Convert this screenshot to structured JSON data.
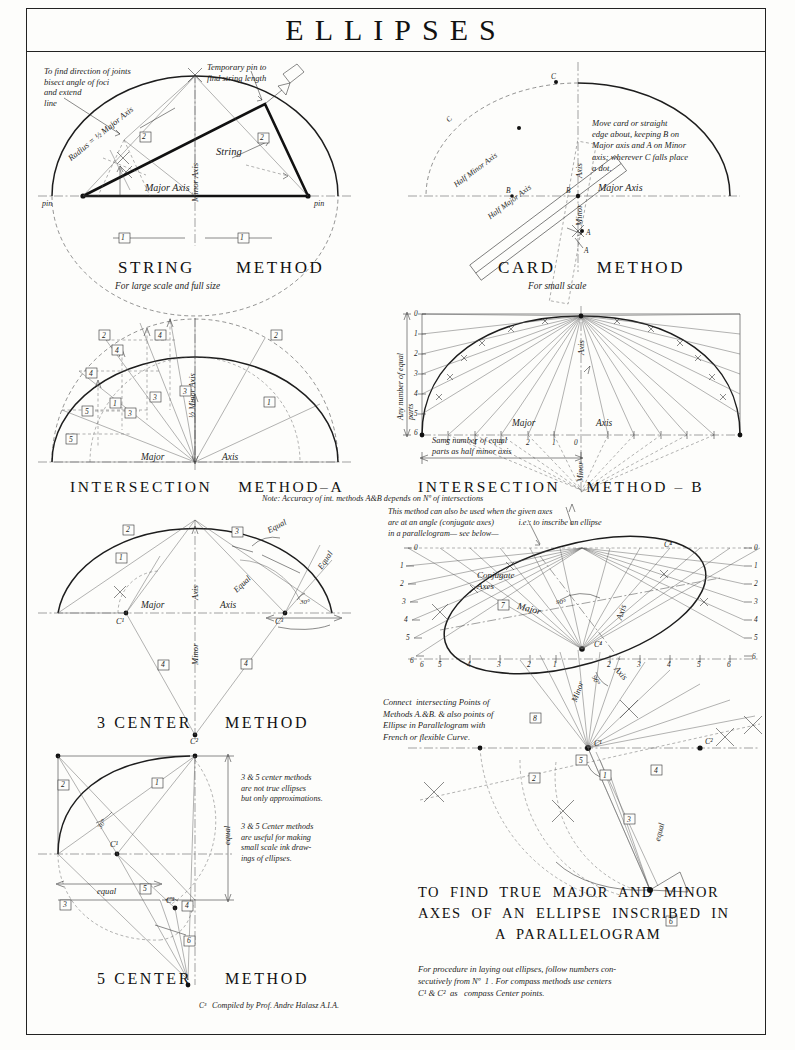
{
  "plate": {
    "title": "ELLIPSES",
    "credit": "Compiled by Prof. Andre Halasz A.I.A.",
    "credit_marker": "C³"
  },
  "panels": {
    "string_method": {
      "heading": "STRING      METHOD",
      "subtitle": "For large scale and full size",
      "notes": [
        "To find direction of joints\nbisect angle of foci\nand extend\nline",
        "Temporary pin to\nfind string length"
      ],
      "labels": {
        "radius": "Radius = ½ Major Axis",
        "string": "String",
        "major_axis": "Major Axis",
        "minor": "Minor",
        "axis": "Axis",
        "pin_left": "pin",
        "pin_right": "pin"
      },
      "steps": [
        "1",
        "1",
        "2",
        "2"
      ]
    },
    "card_method": {
      "heading": "CARD      METHOD",
      "subtitle": "For small scale",
      "note": "Move card or straight\nedge about, keeping B on\nMajor axis and A on Minor\naxis; wherever C falls place\na dot.",
      "labels": {
        "half_minor": "Half Minor Axis",
        "half_major": "Half Major Axis",
        "major_axis": "Major Axis",
        "minor": "Minor",
        "axis": "Axis",
        "points": [
          "A",
          "B",
          "C"
        ],
        "card_points": [
          "A",
          "B",
          "C"
        ]
      }
    },
    "intersection_a": {
      "heading": "INTERSECTION    METHOD–A",
      "note": "Note: Accuracy of int. methods A&B depends on Nº of intersections",
      "labels": {
        "major": "Major",
        "axis": "Axis",
        "half_minor_axis": "½ Minor Axis"
      },
      "steps": [
        "1",
        "1",
        "2",
        "2",
        "3",
        "3",
        "3",
        "4",
        "4",
        "4",
        "5",
        "5"
      ]
    },
    "intersection_b": {
      "heading": "INTERSECTION    METHOD – B",
      "note": "This method can also be used when the given axes\nare at an angle (conjugate axes)            i.e.: to inscribe an ellipse\nin a parallelogram— see below—",
      "labels": {
        "vertical_scale": "Any number of equal\nparts",
        "horizontal_scale": "Same number of equal\nparts as half minor axis",
        "major": "Major",
        "axis": "Axis",
        "minor": "Minor"
      },
      "v_ticks": [
        "0",
        "1",
        "2",
        "3",
        "4",
        "5",
        "6"
      ],
      "h_ticks": [
        "5",
        "4",
        "3",
        "2",
        "1",
        "0"
      ]
    },
    "three_center": {
      "heading": "3 CENTER     METHOD",
      "labels": {
        "major": "Major",
        "axis": "Axis",
        "minor": "Minor",
        "axis_v": "Axis",
        "equal": [
          "Equal",
          "Equal",
          "Equal"
        ],
        "angle": "30°",
        "centers": [
          "C¹",
          "C³",
          "C²"
        ]
      },
      "steps": [
        "1",
        "2",
        "3",
        "4",
        "4"
      ]
    },
    "five_center": {
      "heading": "5 CENTER     METHOD",
      "notes": [
        "3 & 5 center methods\nare not true ellipses\nbut only approximations.",
        "3 & 5 Center methods\nare useful for making\nsmall scale ink draw-\nings of ellipses."
      ],
      "labels": {
        "equal_h": "equal",
        "equal_v": "equal",
        "angle": "30°",
        "centers": [
          "C¹",
          "C³"
        ]
      },
      "steps": [
        "1",
        "2",
        "3",
        "4",
        "5",
        "6"
      ]
    },
    "parallelogram": {
      "heading_lines": [
        "TO  FIND  TRUE  MAJOR  AND  MINOR",
        "AXES  OF  AN  ELLIPSE  INSCRIBED  IN",
        "A  PARALLELOGRAM"
      ],
      "note_connect": "Connect  intersecting Points of\nMethods A.&B. & also points of\nEllipse in Parallelogram with\nFrench or flexible Curve.",
      "note_procedure": "For procedure in laying out ellipses, follow numbers con-\nsecutively from Nº  1 . For compass methods use centers\nC¹ & C²  as   compass Center points.",
      "labels": {
        "conjugate_axes": "Conjugate\nAxes",
        "major": "Major",
        "axis": "Axis",
        "minor": "Minor",
        "axis2": "Axis",
        "angle90_top": "90°",
        "angle90_bottom": "90°",
        "equal": "equal",
        "centers": [
          "C¹",
          "C²",
          "C³",
          "C⁴"
        ]
      },
      "left_ticks": [
        "0",
        "1",
        "2",
        "3",
        "4",
        "5",
        "6"
      ],
      "right_ticks": [
        "0",
        "1",
        "2",
        "3",
        "4",
        "5",
        "6"
      ],
      "base_ticks_left": [
        "6",
        "5",
        "4",
        "3",
        "2",
        "1"
      ],
      "base_ticks_right": [
        "1",
        "2",
        "3",
        "4",
        "5",
        "6"
      ],
      "steps": [
        "1",
        "2",
        "3",
        "4",
        "5",
        "6",
        "7",
        "8"
      ]
    }
  },
  "colors": {
    "ink": "#1d1d1d",
    "paper": "#fdfdfb",
    "construction": "#555555"
  }
}
